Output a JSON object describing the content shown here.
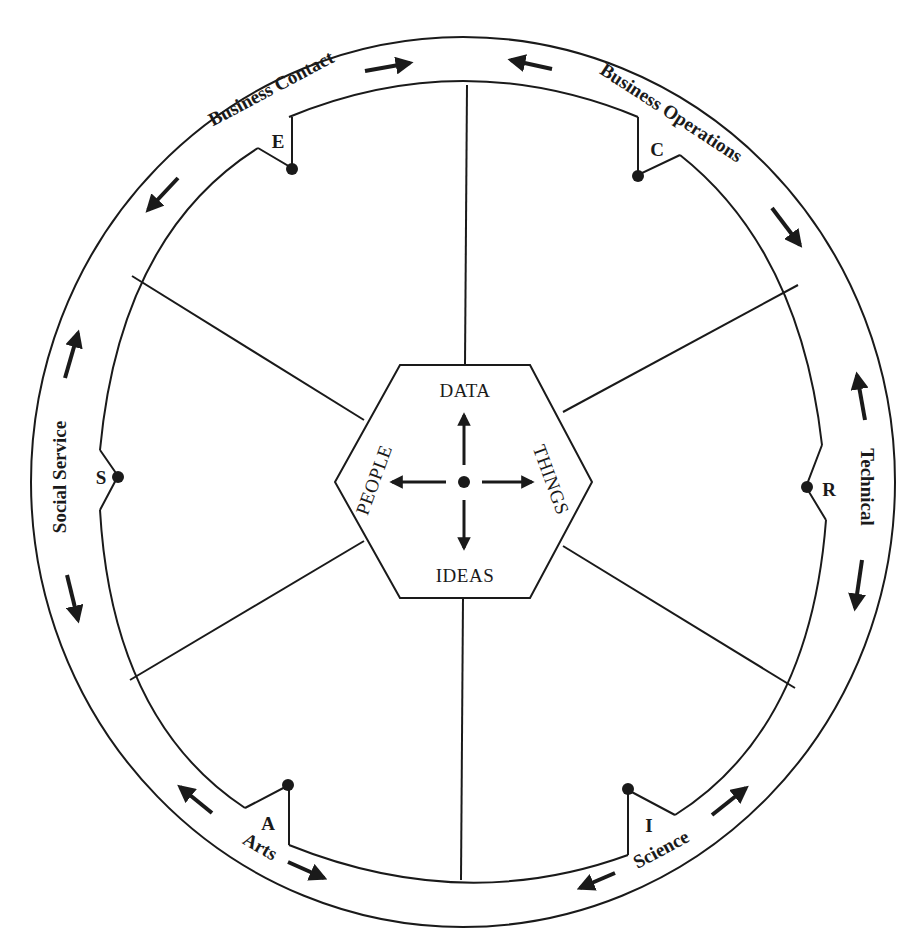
{
  "diagram": {
    "type": "career-clusters-wheel",
    "center_hexagon": {
      "top": "DATA",
      "bottom": "IDEAS",
      "left": "PEOPLE",
      "right": "THINGS"
    },
    "clusters": [
      {
        "code": "E",
        "name": "Business Contact"
      },
      {
        "code": "C",
        "name": "Business Operations"
      },
      {
        "code": "R",
        "name": "Technical"
      },
      {
        "code": "I",
        "name": "Science"
      },
      {
        "code": "A",
        "name": "Arts"
      },
      {
        "code": "S",
        "name": "Social Service"
      }
    ],
    "colors": {
      "line": "#1a1a1a",
      "background": "#ffffff"
    }
  }
}
